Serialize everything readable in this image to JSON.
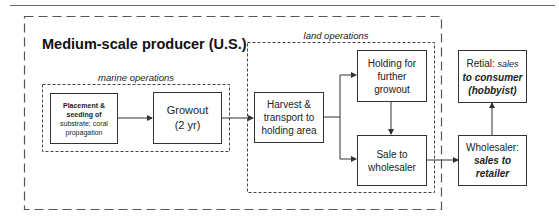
{
  "diagram": {
    "title": "Medium-scale producer (U.S.)",
    "groups": {
      "marine": {
        "label": "marine operations"
      },
      "land": {
        "label": "land operations"
      }
    },
    "nodes": {
      "placement": {
        "lines": [
          "Placement &",
          "seeding of",
          "substrate; coral",
          "propagation"
        ]
      },
      "growout": {
        "lines": [
          "Growout",
          "(2 yr)"
        ]
      },
      "harvest": {
        "lines": [
          "Harvest &",
          "transport to",
          "holding area"
        ]
      },
      "holding": {
        "lines": [
          "Holding for",
          "further",
          "growout"
        ]
      },
      "sale": {
        "lines": [
          "Sale to",
          "wholesaler"
        ]
      },
      "wholesaler": {
        "label": "Wholesaler:",
        "italic_lines": [
          "sales to",
          "retailer"
        ]
      },
      "retail": {
        "label": "Retial:",
        "label_italic": "sales",
        "italic_lines": [
          "to consumer",
          "(hobbyist)"
        ]
      }
    },
    "edges": [
      {
        "from": "placement",
        "to": "growout"
      },
      {
        "from": "growout",
        "to": "harvest"
      },
      {
        "from": "harvest",
        "to": "holding"
      },
      {
        "from": "harvest",
        "to": "sale"
      },
      {
        "from": "holding",
        "to": "sale"
      },
      {
        "from": "sale",
        "to": "wholesaler"
      },
      {
        "from": "wholesaler",
        "to": "retail"
      }
    ],
    "colors": {
      "line": "#333333",
      "dashed": "#555555",
      "text": "#1a1a1a"
    }
  }
}
